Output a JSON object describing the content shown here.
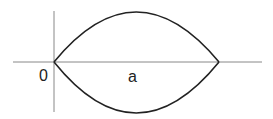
{
  "diagram": {
    "type": "lens-shaped region between two arcs",
    "labels": {
      "origin": "0",
      "point_a": "a"
    },
    "colors": {
      "axis": "#888888",
      "curve": "#222222",
      "label": "#222222"
    }
  }
}
